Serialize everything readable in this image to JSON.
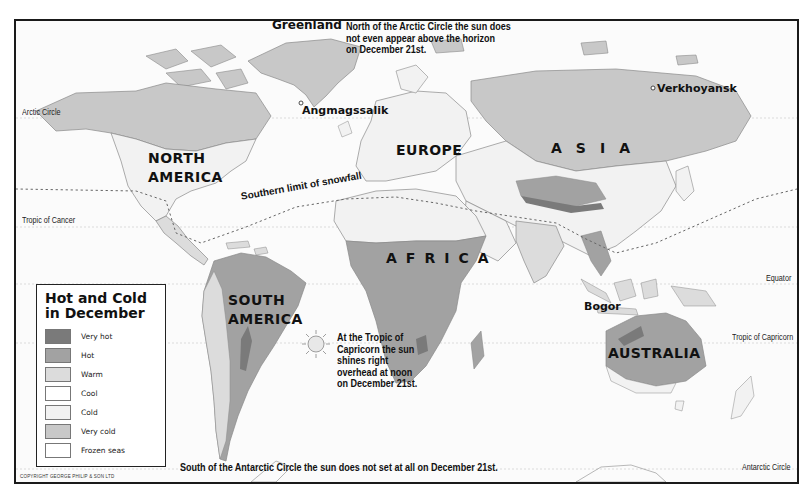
{
  "map": {
    "title": "Hot and Cold in December",
    "colors": {
      "ocean": "#fbfbfb",
      "very_hot": "#7a7a7a",
      "hot": "#a2a2a2",
      "warm": "#dcdcdc",
      "cool": "#ffffff",
      "cold": "#f2f2f2",
      "very_cold": "#c8c8c8",
      "frozen_seas": "#ffffff",
      "coast": "#8a8a8a",
      "text": "#111111"
    },
    "continents": [
      {
        "name": "NORTH AMERICA",
        "line1": "NORTH",
        "line2": "AMERICA"
      },
      {
        "name": "SOUTH AMERICA",
        "line1": "SOUTH",
        "line2": "AMERICA"
      },
      {
        "name": "EUROPE"
      },
      {
        "name": "AFRICA",
        "display": "AFRICA"
      },
      {
        "name": "ASIA",
        "display": "ASIA"
      },
      {
        "name": "AUSTRALIA"
      }
    ],
    "places": [
      {
        "name": "Greenland"
      },
      {
        "name": "Angmagssalik"
      },
      {
        "name": "Verkhoyansk"
      },
      {
        "name": "Bogor"
      }
    ],
    "lines": {
      "arctic_circle": "Arctic Circle",
      "tropic_of_cancer": "Tropic of Cancer",
      "equator": "Equator",
      "tropic_of_capricorn": "Tropic of Capricorn",
      "antarctic_circle": "Antarctic Circle",
      "snowfall_limit": "Southern limit of snowfall"
    },
    "notes": {
      "arctic": [
        "North of the Arctic Circle the sun does",
        "not even appear above the horizon",
        "on December 21st."
      ],
      "capricorn": [
        "At the Tropic of",
        "Capricorn the sun",
        "shines right",
        "overhead at noon",
        "on December 21st."
      ],
      "antarctic": "South of the Antarctic Circle the sun does not set at all on December 21st."
    },
    "copyright": "COPYRIGHT GEORGE PHILIP & SON LTD",
    "sun_icon": "sun-icon"
  },
  "legend": {
    "title_line1": "Hot and Cold",
    "title_line2": "in December",
    "items": [
      {
        "label": "Very hot",
        "color": "#7a7a7a"
      },
      {
        "label": "Hot",
        "color": "#a2a2a2"
      },
      {
        "label": "Warm",
        "color": "#dcdcdc"
      },
      {
        "label": "Cool",
        "color": "#ffffff"
      },
      {
        "label": "Cold",
        "color": "#f2f2f2"
      },
      {
        "label": "Very cold",
        "color": "#c8c8c8"
      },
      {
        "label": "Frozen seas",
        "color": "#ffffff"
      }
    ]
  }
}
